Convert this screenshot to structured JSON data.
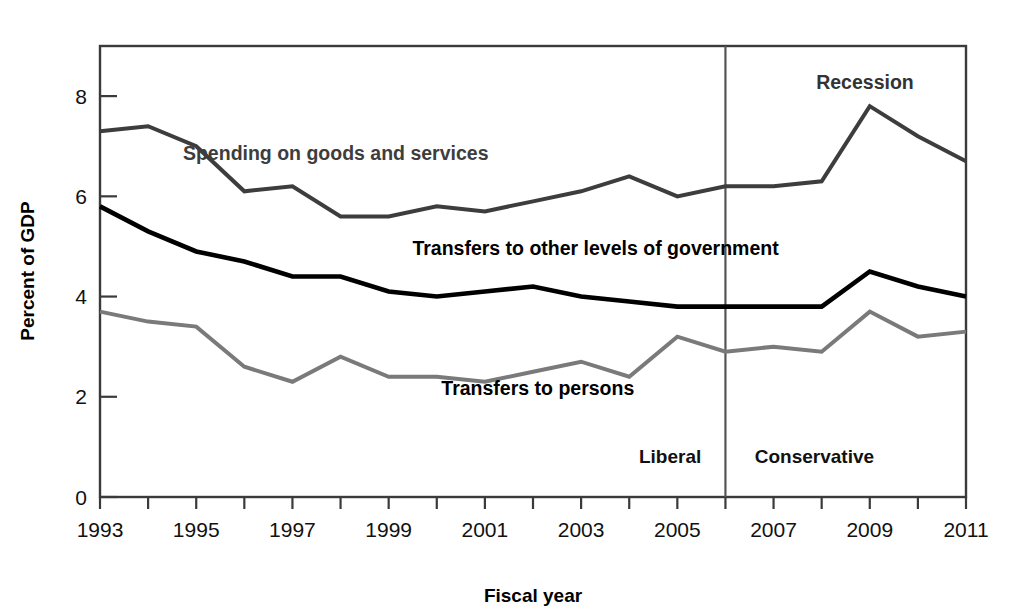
{
  "chart_data": {
    "type": "line",
    "title": "",
    "xlabel": "Fiscal year",
    "ylabel": "Percent of GDP",
    "xlim": [
      1993,
      2011
    ],
    "ylim": [
      0,
      9
    ],
    "grid": false,
    "legend_position": "inline-labels",
    "x": [
      1993,
      1994,
      1995,
      1996,
      1997,
      1998,
      1999,
      2000,
      2001,
      2002,
      2003,
      2004,
      2005,
      2006,
      2007,
      2008,
      2009,
      2010,
      2011
    ],
    "y_ticks": [
      0,
      2,
      4,
      6,
      8
    ],
    "y_tick_labels": [
      "0",
      "2",
      "4",
      "6",
      "8"
    ],
    "x_ticks": [
      1993,
      1994,
      1995,
      1996,
      1997,
      1998,
      1999,
      2000,
      2001,
      2002,
      2003,
      2004,
      2005,
      2006,
      2007,
      2008,
      2009,
      2010,
      2011
    ],
    "x_tick_labels": [
      "1993",
      "",
      "1995",
      "",
      "1997",
      "",
      "1999",
      "",
      "2001",
      "",
      "2003",
      "",
      "2005",
      "",
      "2007",
      "",
      "2009",
      "",
      "2011"
    ],
    "series": [
      {
        "name": "Spending on goods and services",
        "color": "#3d3d3d",
        "width": 4.0,
        "values": [
          7.3,
          7.4,
          7.0,
          6.1,
          6.2,
          5.6,
          5.6,
          5.8,
          5.7,
          5.9,
          6.1,
          6.4,
          6.0,
          6.2,
          6.2,
          6.3,
          7.8,
          7.2,
          6.7
        ]
      },
      {
        "name": "Transfers to other levels of government",
        "color": "#000000",
        "width": 4.6,
        "values": [
          5.8,
          5.3,
          4.9,
          4.7,
          4.4,
          4.4,
          4.1,
          4.0,
          4.1,
          4.2,
          4.0,
          3.9,
          3.8,
          3.8,
          3.8,
          3.8,
          4.5,
          4.2,
          4.0
        ]
      },
      {
        "name": "Transfers to persons",
        "color": "#7a7a7a",
        "width": 4.0,
        "values": [
          3.7,
          3.5,
          3.4,
          2.6,
          2.3,
          2.8,
          2.4,
          2.4,
          2.3,
          2.5,
          2.7,
          2.4,
          3.2,
          2.9,
          3.0,
          2.9,
          3.7,
          3.2,
          3.3
        ]
      }
    ],
    "series_labels": [
      {
        "text": "Spending on goods and services",
        "x": 1997.9,
        "y": 6.73,
        "color": "#3d3d3d",
        "anchor": "middle"
      },
      {
        "text": "Transfers to other levels of government",
        "x": 2003.3,
        "y": 4.82,
        "color": "#000000",
        "anchor": "middle"
      },
      {
        "text": "Transfers to persons",
        "x": 2002.1,
        "y": 2.03,
        "color": "#000000",
        "anchor": "middle"
      }
    ],
    "annotations": [
      {
        "name": "recession",
        "text": "Recession",
        "x": 2008.9,
        "y": 8.15,
        "color": "#333333",
        "anchor": "middle"
      }
    ],
    "divider": {
      "x": 2006,
      "label_left": "Liberal",
      "label_right": "Conservative",
      "label_y": 0.68,
      "color": "#555555"
    },
    "era_labels": [
      {
        "text": "Liberal",
        "x": 2004.85,
        "y": 0.68
      },
      {
        "text": "Conservative",
        "x": 2007.85,
        "y": 0.68
      }
    ],
    "frame_color": "#3a3a3a",
    "background": "#ffffff"
  },
  "axis": {
    "x_title": "Fiscal year",
    "y_title": "Percent of GDP"
  }
}
